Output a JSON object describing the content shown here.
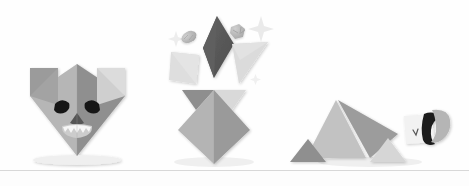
{
  "scene": {
    "title": "Origami paper craft figures",
    "background_color": "#fefefe",
    "width": 469,
    "height": 186,
    "ground_line": {
      "label": "table edge line",
      "color": "#d8d8d8",
      "y": 170
    }
  },
  "palette": {
    "paper_light": "#dcdcdc",
    "paper_lighter": "#e6e6e6",
    "paper_mid": "#b9b9b9",
    "paper_mid_light": "#c6c6c6",
    "paper_dark": "#9a9a9a",
    "paper_darker": "#8c8c8c",
    "paper_charcoal": "#5a5a5a",
    "paper_black": "#1c1c1c",
    "paper_white": "#f4f4f4",
    "shadow": "#e9e9e9",
    "sparkle": "#efefef"
  },
  "figures": [
    {
      "id": "wolf-head",
      "name": "Origami wolf head",
      "position": "left",
      "parts": [
        {
          "name": "left-ear",
          "tone": "paper_dark"
        },
        {
          "name": "right-ear",
          "tone": "paper_light"
        },
        {
          "name": "face-left-panel",
          "tone": "paper_mid"
        },
        {
          "name": "face-right-panel",
          "tone": "paper_darker"
        },
        {
          "name": "left-eyebrow",
          "tone": "paper_black"
        },
        {
          "name": "right-eyebrow",
          "tone": "paper_black"
        },
        {
          "name": "snout",
          "tone": "paper_charcoal"
        },
        {
          "name": "teeth",
          "tone": "paper_white"
        },
        {
          "name": "muzzle",
          "tone": "paper_light"
        }
      ]
    },
    {
      "id": "unfolding-burst",
      "name": "Origami pieces bursting from folded base",
      "position": "center",
      "parts": [
        {
          "name": "dark-diamond",
          "tone": "paper_charcoal"
        },
        {
          "name": "light-square",
          "tone": "paper_light"
        },
        {
          "name": "light-triangle",
          "tone": "paper_light"
        },
        {
          "name": "crumple-ball-small",
          "tone": "paper_mid"
        },
        {
          "name": "crumple-ball-tiny",
          "tone": "paper_mid"
        },
        {
          "name": "sparkle-large",
          "tone": "sparkle"
        },
        {
          "name": "sparkle-small",
          "tone": "sparkle"
        },
        {
          "name": "sparkle-dot",
          "tone": "sparkle"
        },
        {
          "name": "base-left-wing",
          "tone": "paper_darker"
        },
        {
          "name": "base-right-wing",
          "tone": "paper_light"
        },
        {
          "name": "base-left-face",
          "tone": "paper_mid"
        },
        {
          "name": "base-right-face",
          "tone": "paper_dark"
        }
      ]
    },
    {
      "id": "crouching-creature",
      "name": "Origami crouching animal figure",
      "position": "right",
      "parts": [
        {
          "name": "hind-leg",
          "tone": "paper_mid_light"
        },
        {
          "name": "body-back",
          "tone": "paper_dark"
        },
        {
          "name": "rear-foot",
          "tone": "paper_darker"
        },
        {
          "name": "front-foot",
          "tone": "paper_light"
        },
        {
          "name": "head-square",
          "tone": "paper_white"
        },
        {
          "name": "head-black-stripe",
          "tone": "paper_black"
        },
        {
          "name": "head-cap",
          "tone": "paper_mid"
        },
        {
          "name": "head-eye",
          "tone": "paper_charcoal"
        }
      ]
    }
  ]
}
